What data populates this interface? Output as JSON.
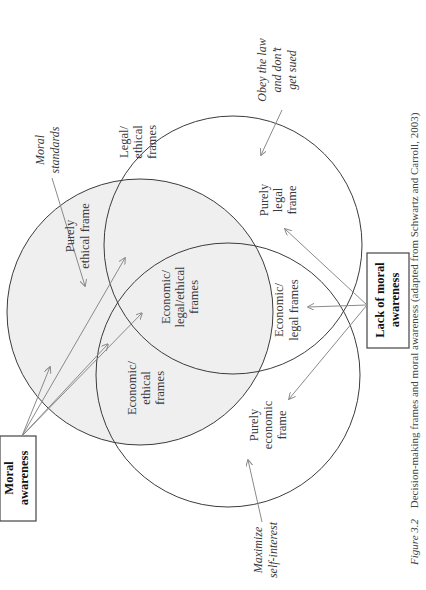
{
  "figure": {
    "rotation_deg": -90,
    "caption": {
      "label": "Figure 3.2",
      "text": "Decision-making frames and moral awareness (adapted from Schwartz and Carroll, 2003)"
    },
    "circles": [
      {
        "id": "ethical",
        "label": "Purely ethical frame",
        "shaded": true
      },
      {
        "id": "legal",
        "label": "Purely legal frame",
        "shaded": false
      },
      {
        "id": "economic",
        "label": "Purely economic frame",
        "shaded": false
      }
    ],
    "regions": {
      "purely_ethical": [
        "Purely",
        "ethical frame"
      ],
      "legal_ethical": [
        "Legal/",
        "ethical",
        "frames"
      ],
      "economic_ethical": [
        "Economic/",
        "ethical",
        "frames"
      ],
      "economic_legal_ethical": [
        "Economic/",
        "legal/ethical",
        "frames"
      ],
      "economic_legal": [
        "Economic/",
        "legal frames"
      ],
      "purely_legal": [
        "Purely",
        "legal",
        "frame"
      ],
      "purely_economic": [
        "Purely",
        "economic",
        "frame"
      ]
    },
    "annotations": {
      "moral_standards": [
        "Moral",
        "standards"
      ],
      "obey_law": [
        "Obey the law",
        "and don’t",
        "get sued"
      ],
      "maximize": [
        "Maximize",
        "self-interest"
      ]
    },
    "boxes": {
      "moral_awareness": [
        "Moral",
        "awareness"
      ],
      "lack_moral_awareness": [
        "Lack of moral",
        "awareness"
      ]
    },
    "colors": {
      "shade": "#efefef",
      "circle_stroke": "#3c3c3c",
      "arrow": "#8a8a8a",
      "box_stroke": "#444444"
    }
  }
}
